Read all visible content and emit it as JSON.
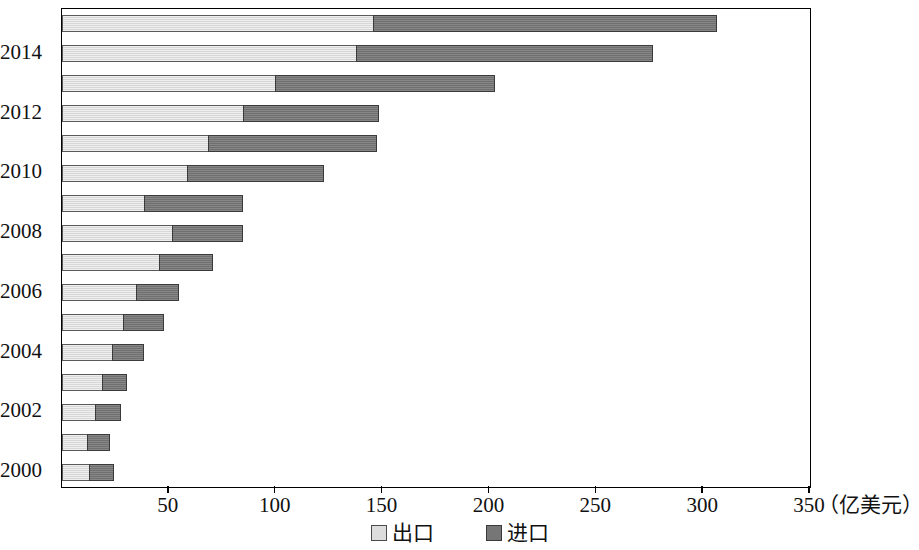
{
  "chart_data": {
    "type": "bar",
    "orientation": "horizontal",
    "stacked": true,
    "title": "",
    "xlabel": "（亿美元）",
    "ylabel": "",
    "xlim": [
      0,
      350
    ],
    "xticks": [
      0,
      50,
      100,
      150,
      200,
      250,
      300,
      350
    ],
    "xtick_labels": [
      "",
      "50",
      "100",
      "150",
      "200",
      "250",
      "300",
      "350"
    ],
    "grid": false,
    "legend_position": "bottom",
    "categories": [
      "2000",
      "2001",
      "2002",
      "2003",
      "2004",
      "2005",
      "2006",
      "2007",
      "2008",
      "2009",
      "2010",
      "2011",
      "2012",
      "2013",
      "2014",
      "2015"
    ],
    "category_labels_shown": [
      "2000",
      "2002",
      "2004",
      "2006",
      "2008",
      "2010",
      "2012",
      "2014"
    ],
    "series": [
      {
        "name": "出口",
        "color": "#dcdcdc",
        "values": [
          13,
          12,
          16,
          19,
          24,
          29,
          35,
          46,
          52,
          39,
          59,
          69,
          85,
          100,
          138,
          146
        ]
      },
      {
        "name": "进口",
        "color": "#767676",
        "values": [
          12,
          11,
          12,
          12,
          15,
          19,
          20,
          25,
          33,
          46,
          64,
          79,
          64,
          103,
          139,
          161
        ]
      }
    ],
    "totals": [
      25,
      23,
      28,
      31,
      39,
      48,
      55,
      71,
      85,
      85,
      123,
      148,
      149,
      203,
      277,
      307
    ]
  },
  "axis": {
    "unit_label": "（亿美元）"
  },
  "legend": {
    "items": [
      {
        "label": "出口",
        "swatch": "export-swatch"
      },
      {
        "label": "进口",
        "swatch": "import-swatch"
      }
    ]
  }
}
